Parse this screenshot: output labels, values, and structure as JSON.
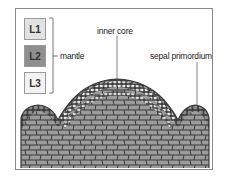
{
  "layers": [
    {
      "label": "L1",
      "color": "#e2e2e2"
    },
    {
      "label": "L2",
      "color": "#8f8f8f"
    },
    {
      "label": "L3",
      "color": "#f2f2f2"
    }
  ],
  "labels": {
    "mantle": "mantle",
    "inner_core": "inner core",
    "sepal_primordium": "sepal primordium"
  },
  "colors": {
    "frame": "#8a8a8a",
    "cell_outline": "#3a3a3a",
    "inner_cells": "#9c9c9c",
    "outer_cells": "#e6e6e6",
    "l2_cells": "#7d7d7d"
  }
}
